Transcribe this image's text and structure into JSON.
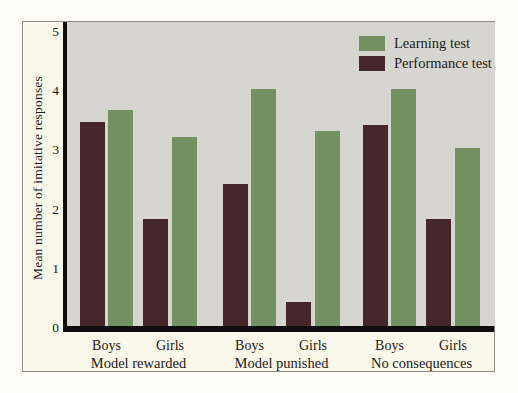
{
  "chart_data": {
    "type": "bar",
    "title": "",
    "ylabel": "Mean number of imitative responses",
    "xlabel": "",
    "ylim": [
      0,
      5
    ],
    "yticks": [
      0,
      1,
      2,
      3,
      4,
      5
    ],
    "grid": false,
    "legend_position": "top-right-inside-plot",
    "plot_background": "#d6d5d0",
    "figure_background": "#faf7eb",
    "axis_color": "#0e0d0c",
    "series": [
      {
        "name": "Learning test",
        "key": "learning",
        "color": "#739261"
      },
      {
        "name": "Performance test",
        "key": "performance",
        "color": "#45262b"
      }
    ],
    "bar_order": [
      "performance",
      "learning"
    ],
    "groups": [
      {
        "label": "Model rewarded",
        "subgroups": [
          {
            "label": "Boys",
            "performance": 3.45,
            "learning": 3.65
          },
          {
            "label": "Girls",
            "performance": 1.8,
            "learning": 3.2
          }
        ]
      },
      {
        "label": "Model punished",
        "subgroups": [
          {
            "label": "Boys",
            "performance": 2.4,
            "learning": 4.0
          },
          {
            "label": "Girls",
            "performance": 0.4,
            "learning": 3.3
          }
        ]
      },
      {
        "label": "No consequences",
        "subgroups": [
          {
            "label": "Boys",
            "performance": 3.4,
            "learning": 4.0
          },
          {
            "label": "Girls",
            "performance": 1.8,
            "learning": 3.0
          }
        ]
      }
    ]
  }
}
